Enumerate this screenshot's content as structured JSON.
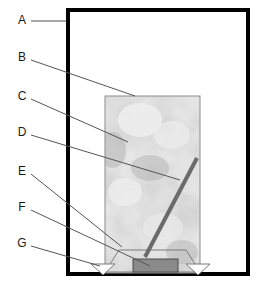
{
  "diagram": {
    "background_color": "#ffffff",
    "width": 263,
    "height": 284
  },
  "colors": {
    "outer_border": "#000000",
    "leader_line": "#555555",
    "label_text": "#1a1a1a",
    "column_fill_light": "#f0f0f0",
    "column_fill_mid": "#c4c4c4",
    "column_fill_dark": "#a8a8a8",
    "column_border": "#8c8c8c",
    "rod": "#6b6b6b",
    "base_block": "#8a8a8a",
    "base_block_border": "#4d4d4d",
    "support_outline": "#7a7a7a"
  },
  "callouts": [
    {
      "id": "A",
      "label": "A",
      "label_x": 22,
      "label_y": 21,
      "line": [
        [
          31,
          21
        ],
        [
          66,
          21
        ]
      ],
      "target": "outer-chamber-wall"
    },
    {
      "id": "B",
      "label": "B",
      "label_x": 22,
      "label_y": 58,
      "line": [
        [
          31,
          60
        ],
        [
          135,
          96
        ]
      ],
      "target": "column-outer-surface"
    },
    {
      "id": "C",
      "label": "C",
      "label_x": 22,
      "label_y": 97,
      "line": [
        [
          31,
          99
        ],
        [
          128,
          142
        ]
      ],
      "target": "column-packing-texture"
    },
    {
      "id": "D",
      "label": "D",
      "label_x": 22,
      "label_y": 133,
      "line": [
        [
          31,
          135
        ],
        [
          180,
          180
        ]
      ],
      "target": "diagonal-rod"
    },
    {
      "id": "E",
      "label": "E",
      "label_x": 22,
      "label_y": 172,
      "line": [
        [
          31,
          174
        ],
        [
          122,
          247
        ]
      ],
      "target": "base-plate"
    },
    {
      "id": "F",
      "label": "F",
      "label_x": 22,
      "label_y": 208,
      "line": [
        [
          31,
          210
        ],
        [
          150,
          266
        ]
      ],
      "target": "base-block"
    },
    {
      "id": "G",
      "label": "G",
      "label_x": 22,
      "label_y": 244,
      "line": [
        [
          31,
          246
        ],
        [
          100,
          266
        ]
      ],
      "target": "support-foot"
    }
  ],
  "parts": {
    "outer_chamber": {
      "name": "outer-chamber",
      "x": 66,
      "y": 8,
      "width": 184,
      "height": 268,
      "border_width": 4
    },
    "column": {
      "name": "packed-column",
      "x": 105,
      "y": 96,
      "width": 95,
      "height": 177
    },
    "rod": {
      "name": "diagonal-rod",
      "x1": 145,
      "y1": 257,
      "x2": 197,
      "y2": 158,
      "stroke_width": 4
    },
    "base_plate": {
      "name": "base-plate",
      "points": "119,250 186,250 200,272 105,272"
    },
    "base_block": {
      "name": "base-block",
      "x": 133,
      "y": 259,
      "width": 45,
      "height": 13
    },
    "support_left": {
      "name": "support-foot-left",
      "points": "91,264 115,264 103,275"
    },
    "support_right": {
      "name": "support-foot-right",
      "points": "186,264 210,264 198,275"
    }
  }
}
